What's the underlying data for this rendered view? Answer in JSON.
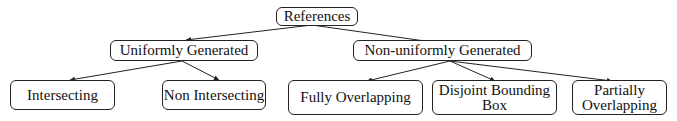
{
  "diagram": {
    "type": "tree",
    "root": {
      "id": "references",
      "label": "References"
    },
    "nodes": [
      {
        "id": "references",
        "label": "References",
        "level": 0
      },
      {
        "id": "uniform",
        "label": "Uniformly Generated",
        "level": 1,
        "parent": "references"
      },
      {
        "id": "nonuniform",
        "label": "Non-uniformly Generated",
        "level": 1,
        "parent": "references"
      },
      {
        "id": "intersecting",
        "label": "Intersecting",
        "level": 2,
        "parent": "uniform"
      },
      {
        "id": "nonintersecting",
        "label": "Non Intersecting",
        "level": 2,
        "parent": "uniform"
      },
      {
        "id": "fully",
        "label": "Fully Overlapping",
        "level": 2,
        "parent": "nonuniform"
      },
      {
        "id": "disjoint",
        "label_line1": "Disjoint Bounding",
        "label_line2": "Box",
        "level": 2,
        "parent": "nonuniform"
      },
      {
        "id": "partially",
        "label_line1": "Partially",
        "label_line2": "Overlapping",
        "level": 2,
        "parent": "nonuniform"
      }
    ],
    "edges": [
      [
        "references",
        "uniform"
      ],
      [
        "references",
        "nonuniform"
      ],
      [
        "uniform",
        "intersecting"
      ],
      [
        "uniform",
        "nonintersecting"
      ],
      [
        "nonuniform",
        "fully"
      ],
      [
        "nonuniform",
        "disjoint"
      ],
      [
        "nonuniform",
        "partially"
      ]
    ]
  },
  "labels": {
    "references": "References",
    "uniform": "Uniformly Generated",
    "nonuniform": "Non-uniformly Generated",
    "intersecting": "Intersecting",
    "nonintersecting": "Non Intersecting",
    "fully": "Fully Overlapping",
    "disjoint_1": "Disjoint Bounding",
    "disjoint_2": "Box",
    "partially_1": "Partially",
    "partially_2": "Overlapping"
  }
}
